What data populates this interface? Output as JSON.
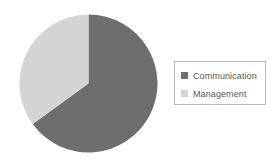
{
  "chart_data": {
    "type": "pie",
    "title": "",
    "categories": [
      "Communication",
      "Management"
    ],
    "values": [
      65,
      35
    ],
    "colors": [
      "#6e6e6e",
      "#d4d4d4"
    ],
    "legend_position": "right",
    "grid": false,
    "slices": [
      {
        "label": "Communication",
        "value": 65,
        "color": "#6e6e6e",
        "start_angle_deg": 0,
        "end_angle_deg": 234
      },
      {
        "label": "Management",
        "value": 35,
        "color": "#d4d4d4",
        "start_angle_deg": 234,
        "end_angle_deg": 360
      }
    ]
  },
  "legend": {
    "items": [
      {
        "label": "Communication",
        "color": "#6e6e6e",
        "swatch": "legend-swatch-square"
      },
      {
        "label": "Management",
        "color": "#d4d4d4",
        "swatch": "legend-swatch-square"
      }
    ]
  },
  "style": {
    "background": "#ffffff",
    "border_color": "#b9b9b9",
    "text_color": "#555555"
  }
}
